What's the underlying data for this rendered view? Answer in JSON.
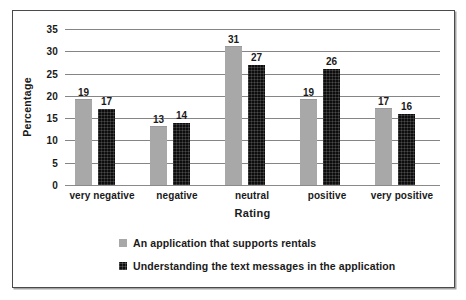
{
  "chart_data": {
    "type": "bar",
    "title": "",
    "xlabel": "Rating",
    "ylabel": "Percentage",
    "categories": [
      "very negative",
      "negative",
      "neutral",
      "positive",
      "very positive"
    ],
    "series": [
      {
        "name": "An application that supports rentals",
        "color": "#a8a8a8",
        "values": [
          19,
          13,
          31,
          19,
          17
        ]
      },
      {
        "name": "Understanding the text messages in the application",
        "color": "#0d0d0d",
        "values": [
          17,
          14,
          27,
          26,
          16
        ]
      }
    ],
    "ylim": [
      0,
      35
    ],
    "yticks": [
      0,
      5,
      10,
      15,
      20,
      25,
      30,
      35
    ],
    "ytick_labels": [
      "0",
      "5",
      "10",
      "15",
      "20",
      "25",
      "30",
      "35"
    ],
    "grid": "horizontal",
    "legend_position": "bottom-left",
    "data_labels": true
  },
  "frame": {
    "border_color": "#4a4a4a",
    "background": "#ffffff"
  }
}
